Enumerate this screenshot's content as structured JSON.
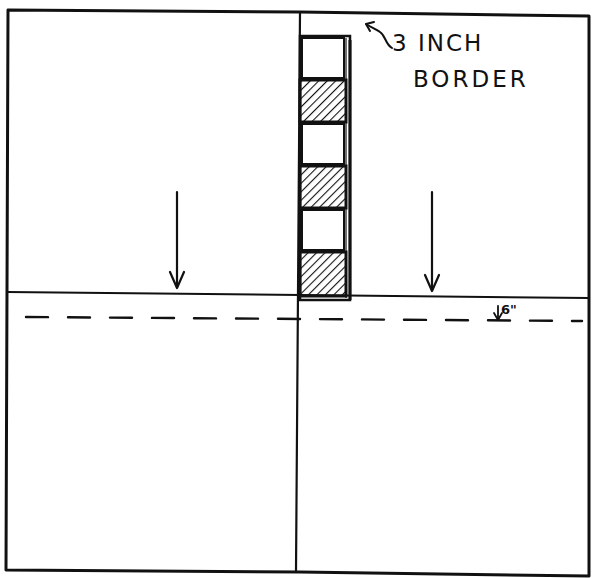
{
  "diagram": {
    "type": "quilt block layout sketch",
    "frame": {
      "description": "square outer frame divided into four quadrants"
    },
    "border_strip": {
      "description": "vertical strip of alternating plain and hatched squares at top of center line",
      "squares": [
        "plain",
        "hatched",
        "plain",
        "hatched",
        "plain",
        "hatched"
      ]
    },
    "annotations": {
      "border_label_line1": "3 INCH",
      "border_label_line2": "BORDER",
      "offset_label": "6\""
    },
    "arrows": [
      {
        "name": "left-down-arrow",
        "direction": "down"
      },
      {
        "name": "right-down-arrow",
        "direction": "down"
      },
      {
        "name": "border-pointer-arrow",
        "direction": "up-left"
      },
      {
        "name": "offset-arrow",
        "direction": "down"
      }
    ],
    "dashed_line": {
      "description": "horizontal dashed guideline 6 inches below center line"
    },
    "colors": {
      "ink": "#111111",
      "paper": "#ffffff"
    }
  }
}
